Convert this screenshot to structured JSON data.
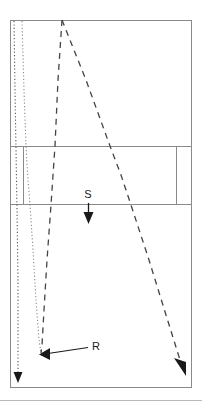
{
  "figure": {
    "type": "seismic-ray-path-diagram",
    "background_color": "#ffffff",
    "frame": {
      "x": 10,
      "y": 20,
      "width": 182,
      "height": 368,
      "stroke_color": "#808080",
      "stroke_width": 1
    },
    "layers": [
      {
        "name": "upper-layer",
        "top": 20,
        "bottom": 146
      },
      {
        "name": "middle-layer",
        "top": 146,
        "bottom": 204
      },
      {
        "name": "lower-layer",
        "top": 204,
        "bottom": 388
      }
    ],
    "layer_dividers": [
      {
        "name": "divider-upper-middle",
        "y": 146
      },
      {
        "name": "divider-middle-lower",
        "y": 204
      }
    ],
    "internal_verticals": [
      {
        "name": "middle-layer-left-boundary",
        "x": 23,
        "y1": 146,
        "y2": 204
      },
      {
        "name": "middle-layer-right-boundary",
        "x": 176,
        "y1": 146,
        "y2": 204
      }
    ]
  },
  "labels": {
    "source": {
      "text": "S",
      "x": 88,
      "y": 198,
      "arrow": {
        "x": 88,
        "y_start": 203,
        "y_end": 223
      }
    },
    "receiver": {
      "text": "R",
      "x": 92,
      "y": 350,
      "leader": {
        "x_start": 88,
        "y_start": 347,
        "x_end": 41,
        "y_end": 354
      }
    }
  },
  "rays": {
    "dotted": [
      {
        "name": "dotted-ray-outer",
        "style": "dotted",
        "color": "#555555",
        "points": "14,20 16,200 18,300 18,374",
        "arrowhead": {
          "x": 18,
          "y": 382,
          "direction": "down"
        }
      },
      {
        "name": "dotted-ray-inner",
        "style": "dotted",
        "color": "#777777",
        "points": "22,20 26,146 30,204 38,340 41,353"
      }
    ],
    "dashed": [
      {
        "name": "dashed-ray-down-left",
        "style": "dashed",
        "color": "#444444",
        "points": "62,20 54,146 50,204 42,340 41,353",
        "apex": {
          "x": 62,
          "y": 20
        }
      },
      {
        "name": "dashed-ray-down-right",
        "style": "dashed",
        "color": "#444444",
        "points": "62,20 110,146 131,204 176,354 184,369",
        "arrowhead": {
          "x": 185,
          "y": 373,
          "direction": "down-right"
        }
      }
    ]
  },
  "baseline_rule": {
    "name": "bottom-rule",
    "y": 400,
    "x1": 0,
    "x2": 202,
    "color": "#b0b0b0"
  }
}
